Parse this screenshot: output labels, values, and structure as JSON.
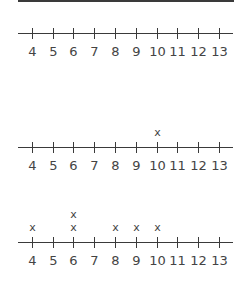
{
  "chart_data": [
    {
      "type": "dot_plot",
      "title": "",
      "xlabel": "",
      "ylabel": "",
      "categories": [
        4,
        5,
        6,
        7,
        8,
        9,
        10,
        11,
        12,
        13
      ],
      "values": [
        0,
        0,
        0,
        0,
        0,
        0,
        0,
        0,
        0,
        0
      ],
      "marker": "x"
    },
    {
      "type": "dot_plot",
      "title": "",
      "xlabel": "",
      "ylabel": "",
      "categories": [
        4,
        5,
        6,
        7,
        8,
        9,
        10,
        11,
        12,
        13
      ],
      "values": [
        0,
        0,
        0,
        0,
        0,
        0,
        1,
        0,
        0,
        0
      ],
      "marker": "x"
    },
    {
      "type": "dot_plot",
      "title": "",
      "xlabel": "",
      "ylabel": "",
      "categories": [
        4,
        5,
        6,
        7,
        8,
        9,
        10,
        11,
        12,
        13
      ],
      "values": [
        1,
        0,
        2,
        0,
        1,
        1,
        1,
        0,
        0,
        0
      ],
      "marker": "x"
    }
  ],
  "plots": [
    {
      "axis_y": 33
    },
    {
      "axis_y": 147
    },
    {
      "axis_y": 242
    }
  ],
  "ticks": [
    "4",
    "5",
    "6",
    "7",
    "8",
    "9",
    "10",
    "11",
    "12",
    "13"
  ],
  "tick_x": [
    32,
    53,
    73,
    94,
    115,
    136,
    157,
    177,
    198,
    219
  ],
  "marker_glyph": "x"
}
